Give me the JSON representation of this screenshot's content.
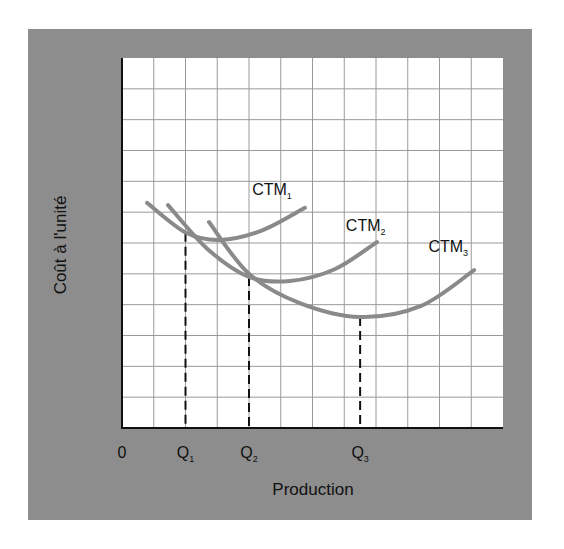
{
  "chart_data": {
    "type": "line",
    "title": "",
    "xlabel": "Production",
    "ylabel": "Coût à l'unité",
    "xlim": [
      0,
      12
    ],
    "ylim": [
      0,
      12
    ],
    "grid": true,
    "x_ticks": [
      {
        "value": 0,
        "label": "0",
        "sub": ""
      },
      {
        "value": 2.0,
        "label": "Q",
        "sub": "1"
      },
      {
        "value": 4.0,
        "label": "Q",
        "sub": "2"
      },
      {
        "value": 7.5,
        "label": "Q",
        "sub": "3"
      }
    ],
    "series": [
      {
        "name": "CTM1",
        "label": "CTM",
        "label_sub": "1",
        "points": [
          [
            0.79,
            7.3
          ],
          [
            2.02,
            6.33
          ],
          [
            3.09,
            6.1
          ],
          [
            4.4,
            6.4
          ],
          [
            5.76,
            7.14
          ]
        ],
        "label_at": [
          4.1,
          7.55
        ]
      },
      {
        "name": "CTM2",
        "label": "CTM",
        "label_sub": "2",
        "points": [
          [
            1.45,
            7.23
          ],
          [
            2.7,
            5.8
          ],
          [
            4.0,
            4.9
          ],
          [
            5.29,
            4.77
          ],
          [
            6.7,
            5.15
          ],
          [
            8.03,
            6.03
          ]
        ],
        "label_at": [
          7.05,
          6.4
        ]
      },
      {
        "name": "CTM3",
        "label": "CTM",
        "label_sub": "3",
        "points": [
          [
            2.74,
            6.68
          ],
          [
            4.0,
            5.0
          ],
          [
            5.6,
            4.05
          ],
          [
            7.5,
            3.6
          ],
          [
            9.4,
            3.95
          ],
          [
            11.09,
            5.12
          ]
        ],
        "label_at": [
          9.65,
          5.7
        ]
      }
    ],
    "reference_lines": [
      {
        "name": "Q1",
        "x": 2.0,
        "y_top": 6.33
      },
      {
        "name": "Q2",
        "x": 4.0,
        "y_top": 4.9
      },
      {
        "name": "Q3",
        "x": 7.5,
        "y_top": 3.6
      }
    ],
    "legend": "none",
    "colors": {
      "panel": "#8d8d8d",
      "plot_bg": "#ffffff",
      "grid": "#9a9a9a",
      "axis": "#111111",
      "curve": "#8a8a8a",
      "dash": "#111111"
    }
  }
}
